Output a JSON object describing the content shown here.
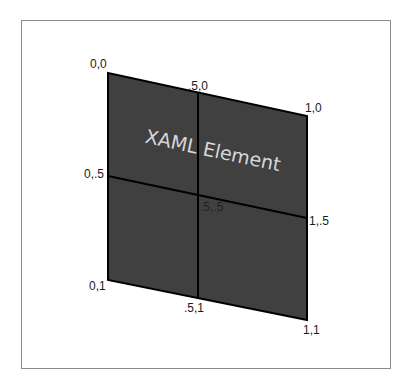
{
  "diagram": {
    "element_label": "XAML Element",
    "fill_color": "#404040",
    "line_color": "#000000",
    "frame_color": "#8a8a8a",
    "corner_labels": {
      "top_left": "0,0",
      "top_mid": ".5,0",
      "top_right": "1,0",
      "mid_left": "0,.5",
      "center": ".5,.5",
      "mid_right": "1,.5",
      "bottom_left": "0,1",
      "bottom_mid": ".5,1",
      "bottom_right": "1,1"
    }
  }
}
